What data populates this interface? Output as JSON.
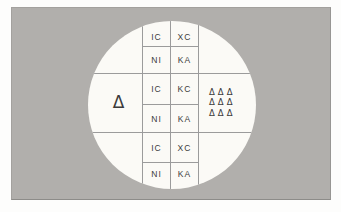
{
  "diagram": {
    "left_cell": {
      "symbol": "Δ"
    },
    "right_cell": {
      "rows": [
        "ΔΔΔ",
        "ΔΔΔ",
        "ΔΔΔ"
      ]
    },
    "bands": [
      {
        "name": "top",
        "rows": [
          {
            "left": "IC",
            "right": "XC"
          },
          {
            "left": "NI",
            "right": "KA"
          }
        ]
      },
      {
        "name": "middle",
        "rows": [
          {
            "left": "IC",
            "right": "KC"
          },
          {
            "left": "NI",
            "right": "KA"
          }
        ]
      },
      {
        "name": "bottom",
        "rows": [
          {
            "left": "IC",
            "right": "XC"
          },
          {
            "left": "NI",
            "right": "KA"
          }
        ]
      }
    ],
    "colors": {
      "panel": "#b1afac",
      "circle": "#fbfaf6",
      "line": "#9b9b9b",
      "ink": "#3b3b3b"
    }
  }
}
